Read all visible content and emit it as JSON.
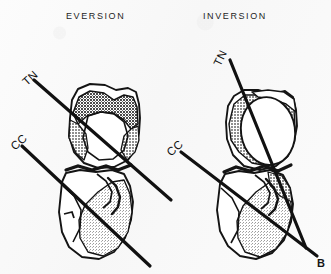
{
  "figure": {
    "panel_letter": "B",
    "background_color": "#fafafa",
    "ink_color": "#111111",
    "width": 331,
    "height": 274
  },
  "panels": [
    {
      "id": "eversion",
      "title": "EVERSION",
      "axes": [
        {
          "id": "tn",
          "label": "TN",
          "name": "talonavicular-axis"
        },
        {
          "id": "cc",
          "label": "CC",
          "name": "calcaneocuboid-axis"
        }
      ]
    },
    {
      "id": "inversion",
      "title": "INVERSION",
      "axes": [
        {
          "id": "tn",
          "label": "TN",
          "name": "talonavicular-axis"
        },
        {
          "id": "cc",
          "label": "CC",
          "name": "calcaneocuboid-axis"
        }
      ]
    }
  ],
  "shading": {
    "dark_gray": "#8a8a8a",
    "mid_gray": "#a8a8a8",
    "light_gray": "#c9c9c9",
    "outline": "#141414"
  }
}
